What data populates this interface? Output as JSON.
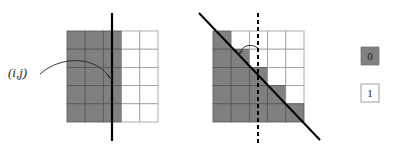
{
  "colors": {
    "zero": "#808080",
    "one": "#ffffff",
    "grid_line": "#444444",
    "line": "#000000"
  },
  "left_panel": {
    "label": "(i,j)",
    "grid": [
      [
        0,
        0,
        0,
        1,
        1
      ],
      [
        0,
        0,
        0,
        1,
        1
      ],
      [
        0,
        0,
        0,
        1,
        1
      ],
      [
        0,
        0,
        0,
        1,
        1
      ],
      [
        0,
        0,
        0,
        1,
        1
      ]
    ],
    "separator": "solid vertical line"
  },
  "right_panel": {
    "grid": [
      [
        0,
        1,
        1,
        1,
        1
      ],
      [
        0,
        0,
        1,
        1,
        1
      ],
      [
        0,
        0,
        0,
        1,
        1
      ],
      [
        0,
        0,
        0,
        0,
        1
      ],
      [
        0,
        0,
        0,
        0,
        0
      ]
    ],
    "separator": "solid diagonal line",
    "reference": "dashed vertical line"
  },
  "legend": [
    {
      "label": "0",
      "color": "#808080"
    },
    {
      "label": "1",
      "color": "#ffffff"
    }
  ]
}
